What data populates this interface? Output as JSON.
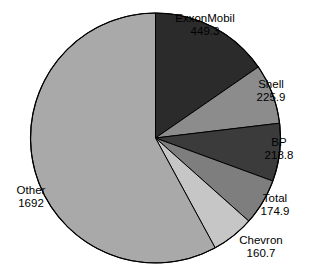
{
  "chart_data": {
    "type": "pie",
    "title": "",
    "subtitle": "",
    "xlabel": "",
    "ylabel": "",
    "legend_position": "none",
    "grid": false,
    "categories": [
      "ExxonMobil",
      "Shell",
      "BP",
      "Total",
      "Chevron",
      "Other"
    ],
    "values": [
      449.3,
      225.9,
      218.8,
      174.9,
      160.7,
      1692
    ],
    "value_labels": [
      "449.3",
      "225.9",
      "218.8",
      "174.9",
      "160.7",
      "1692"
    ],
    "total": 2921.6,
    "start_angle_deg": 0,
    "direction": "clockwise",
    "slices": [
      {
        "label": "ExxonMobil",
        "value": 449.3,
        "value_label": "449.3",
        "color": "#2b2b2b",
        "start_deg": 0,
        "end_deg": 55.36,
        "percent": 15.4
      },
      {
        "label": "Shell",
        "value": 225.9,
        "value_label": "225.9",
        "color": "#8c8c8c",
        "start_deg": 55.36,
        "end_deg": 83.19,
        "percent": 7.7
      },
      {
        "label": "BP",
        "value": 218.8,
        "value_label": "218.8",
        "color": "#3b3b3b",
        "start_deg": 83.19,
        "end_deg": 110.15,
        "percent": 7.5
      },
      {
        "label": "Total",
        "value": 174.9,
        "value_label": "174.9",
        "color": "#7e7e7e",
        "start_deg": 110.15,
        "end_deg": 131.7,
        "percent": 6.0
      },
      {
        "label": "Chevron",
        "value": 160.7,
        "value_label": "160.7",
        "color": "#c6c6c6",
        "start_deg": 131.7,
        "end_deg": 151.5,
        "percent": 5.5
      },
      {
        "label": "Other",
        "value": 1692,
        "value_label": "1692",
        "color": "#a9a9a9",
        "start_deg": 151.5,
        "end_deg": 360,
        "percent": 57.9
      }
    ],
    "geometry": {
      "center_x": 155.5,
      "center_y": 138,
      "radius": 125
    },
    "colors": {
      "exxonmobil": "#2b2b2b",
      "shell": "#8c8c8c",
      "bp": "#3b3b3b",
      "total": "#7e7e7e",
      "chevron": "#c6c6c6",
      "other": "#a9a9a9",
      "outline": "#000000",
      "background": "#ffffff",
      "text": "#000000"
    }
  }
}
